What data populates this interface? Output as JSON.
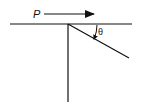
{
  "diagram": {
    "labels": {
      "force": "P",
      "angle": "θ"
    },
    "elements": [
      {
        "type": "horizontal-line",
        "description": "horizontal surface / bar"
      },
      {
        "type": "vertical-line",
        "description": "vertical member downward from pivot"
      },
      {
        "type": "inclined-line",
        "description": "member inclined at angle θ below horizontal"
      },
      {
        "type": "force-arrow",
        "label": "P",
        "direction": "right"
      },
      {
        "type": "angle-arc",
        "label": "θ"
      }
    ],
    "colors": {
      "stroke": "#111111",
      "background": "#ffffff"
    }
  }
}
